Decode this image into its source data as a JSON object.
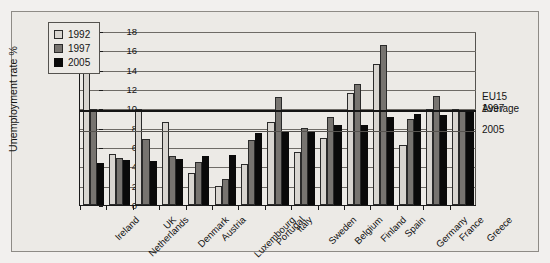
{
  "chart_data": {
    "type": "bar",
    "title": "",
    "xlabel": "",
    "ylabel": "Unemployment rate %",
    "ylim": [
      0,
      18
    ],
    "ytick_step": 2,
    "yticks": [
      0,
      2,
      4,
      6,
      8,
      10,
      12,
      14,
      16,
      18
    ],
    "grid": true,
    "legend_position": "top-left",
    "categories": [
      "Ireland",
      "Netherlands",
      "UK",
      "Denmark",
      "Austria",
      "Luxembourg",
      "Portugal",
      "Italy",
      "Sweden",
      "Belgium",
      "Finland",
      "Spain",
      "Germany",
      "France",
      "Greece"
    ],
    "series": [
      {
        "name": "1992",
        "color": "#d8d5d0",
        "values": [
          15.4,
          5.3,
          9.9,
          8.6,
          3.3,
          2.0,
          4.2,
          8.6,
          5.5,
          6.9,
          11.6,
          14.6,
          6.2,
          9.9,
          9.9
        ]
      },
      {
        "name": "1997",
        "color": "#777470",
        "values": [
          9.9,
          4.9,
          6.8,
          5.1,
          4.4,
          2.7,
          6.7,
          11.2,
          8.0,
          9.1,
          12.5,
          16.6,
          8.9,
          11.3,
          9.8
        ]
      },
      {
        "name": "2005",
        "color": "#0a0a0a",
        "values": [
          4.3,
          4.7,
          4.6,
          4.8,
          5.1,
          5.2,
          7.5,
          7.6,
          7.7,
          8.3,
          8.3,
          9.1,
          9.4,
          9.3,
          9.8
        ]
      }
    ],
    "reference_lines": [
      {
        "label": "1997",
        "value": 9.9,
        "style": "thick-black"
      },
      {
        "label": "2005",
        "value": 7.8,
        "style": "thin-grey"
      }
    ],
    "annotations": {
      "eu15_title_line1": "EU15",
      "eu15_title_line2": "Average",
      "eu15_ref_1997": "1997",
      "eu15_ref_2005": "2005"
    }
  },
  "legend": {
    "items": [
      {
        "label": "1992"
      },
      {
        "label": "1997"
      },
      {
        "label": "2005"
      }
    ]
  }
}
